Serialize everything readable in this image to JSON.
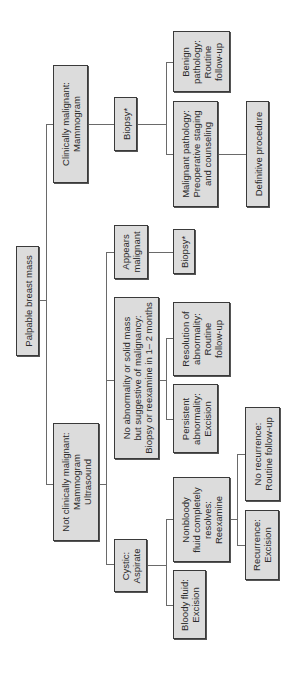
{
  "diagram": {
    "orientation": "rotated 90 degrees counter-clockwise; text reads bottom-to-top",
    "colors": {
      "box_fill": "#dcdcdc",
      "box_border": "#3a3a3a",
      "connector": "#6a6a6a",
      "background": "#ffffff"
    },
    "nodes": {
      "root": "Palpable breast mass",
      "clin_malignant": "Clinically malignant:\nMammogram",
      "biopsy_1": "Biopsy*",
      "benign": "Benign\npathology:\nRoutine\nfollow-up",
      "malignant_path": "Malignant pathology:\nPreoperative staging\nand counseling",
      "definitive": "Definitive procedure",
      "not_clin_malignant": "Not clinically malignant:\nMammogram\nUltrasound",
      "appears_malignant": "Appears\nmalignant",
      "biopsy_2": "Biopsy*",
      "no_abnormality": "No abnormality or solid mass\nbut suggestive of malignancy:\nBiopsy or reexamine in 1– 2 months",
      "resolution": "Resolution of\nabnormality:\nRoutine\nfollow-up",
      "persistent": "Persistent\nabnormality:\nExcision",
      "cystic": "Cystic:\nAspirate",
      "nonbloody": "Nonbloody\nfluid completely\nresolves:\nReexamine",
      "bloody": "Bloody fluid:\nExcision",
      "no_recurrence": "No recurrence:\nRoutine follow-up",
      "recurrence": "Recurrence:\nExcision"
    },
    "edges": [
      [
        "root",
        "clin_malignant"
      ],
      [
        "root",
        "not_clin_malignant"
      ],
      [
        "clin_malignant",
        "biopsy_1"
      ],
      [
        "biopsy_1",
        "benign"
      ],
      [
        "biopsy_1",
        "malignant_path"
      ],
      [
        "malignant_path",
        "definitive"
      ],
      [
        "not_clin_malignant",
        "appears_malignant"
      ],
      [
        "not_clin_malignant",
        "no_abnormality"
      ],
      [
        "not_clin_malignant",
        "cystic"
      ],
      [
        "appears_malignant",
        "biopsy_2"
      ],
      [
        "no_abnormality",
        "resolution"
      ],
      [
        "no_abnormality",
        "persistent"
      ],
      [
        "cystic",
        "nonbloody"
      ],
      [
        "cystic",
        "bloody"
      ],
      [
        "nonbloody",
        "no_recurrence"
      ],
      [
        "nonbloody",
        "recurrence"
      ]
    ]
  }
}
